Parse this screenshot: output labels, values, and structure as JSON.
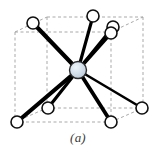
{
  "figure": {
    "caption": "(a)",
    "background_color": "#ffffff"
  },
  "style": {
    "cell_edge_color": "#a9a9a9",
    "cell_edge_dash": "3 2.5",
    "cell_edge_width": 1,
    "bond_color": "#000000",
    "bond_width_near": 4.2,
    "bond_width_far": 2.2,
    "corner_atom_fill": "#ffffff",
    "corner_atom_stroke": "#101010",
    "corner_atom_stroke_width": 1.6,
    "corner_atom_radius": 6,
    "center_atom_fill": "#ccd9e8",
    "center_atom_stroke": "#2b2b2b",
    "center_atom_stroke_width": 1.4,
    "center_atom_radius": 8.5,
    "center_atom_highlight": "#eef4fa"
  },
  "structure": {
    "type": "body-centered-cubic",
    "coordination_number": 8,
    "center_atom": {
      "id": "body-center",
      "label": "body-center atom",
      "x": 78,
      "y": 70,
      "fractional": [
        0.5,
        0.5,
        0.5
      ]
    },
    "corner_atoms": [
      {
        "id": "corner-front-top-left",
        "label": "front top left corner atom",
        "x": 33,
        "y": 23,
        "fractional": [
          0,
          1,
          0
        ]
      },
      {
        "id": "corner-back-top-left",
        "label": "back top left corner atom",
        "x": 93,
        "y": 16,
        "fractional": [
          0,
          1,
          1
        ]
      },
      {
        "id": "corner-back-top-right",
        "label": "back top right corner atom",
        "x": 113,
        "y": 27,
        "fractional": [
          1,
          1,
          1
        ]
      },
      {
        "id": "corner-front-top-right",
        "label": "front top right corner atom",
        "x": 111,
        "y": 33,
        "fractional": [
          1,
          1,
          0
        ]
      },
      {
        "id": "corner-front-bottom-left",
        "label": "front bottom left corner atom",
        "x": 17,
        "y": 122,
        "fractional": [
          0,
          0,
          0
        ]
      },
      {
        "id": "corner-back-bottom-left",
        "label": "back bottom left corner atom",
        "x": 48,
        "y": 108,
        "fractional": [
          0,
          0,
          1
        ]
      },
      {
        "id": "corner-front-bottom-right",
        "label": "front bottom right corner atom",
        "x": 111,
        "y": 122,
        "fractional": [
          1,
          0,
          0
        ]
      },
      {
        "id": "corner-back-bottom-right",
        "label": "back bottom right corner atom",
        "x": 142,
        "y": 108,
        "fractional": [
          1,
          0,
          1
        ]
      }
    ],
    "bonds": [
      {
        "id": "bond-front-top-left",
        "from": "body-center",
        "to": "corner-front-top-left",
        "x1": 78,
        "y1": 70,
        "x2": 33,
        "y2": 23,
        "width": 4.2
      },
      {
        "id": "bond-back-top-left",
        "from": "body-center",
        "to": "corner-back-top-left",
        "x1": 78,
        "y1": 70,
        "x2": 93,
        "y2": 16,
        "width": 3.2
      },
      {
        "id": "bond-back-top-right",
        "from": "body-center",
        "to": "corner-back-top-right",
        "x1": 78,
        "y1": 70,
        "x2": 113,
        "y2": 27,
        "width": 3.0
      },
      {
        "id": "bond-front-top-right",
        "from": "body-center",
        "to": "corner-front-top-right",
        "x1": 78,
        "y1": 70,
        "x2": 111,
        "y2": 33,
        "width": 3.6
      },
      {
        "id": "bond-front-bottom-left",
        "from": "body-center",
        "to": "corner-front-bottom-left",
        "x1": 78,
        "y1": 70,
        "x2": 17,
        "y2": 122,
        "width": 4.2
      },
      {
        "id": "bond-back-bottom-left",
        "from": "body-center",
        "to": "corner-back-bottom-left",
        "x1": 78,
        "y1": 70,
        "x2": 48,
        "y2": 108,
        "width": 3.2
      },
      {
        "id": "bond-front-bottom-right",
        "from": "body-center",
        "to": "corner-front-bottom-right",
        "x1": 78,
        "y1": 70,
        "x2": 111,
        "y2": 122,
        "width": 3.8
      },
      {
        "id": "bond-back-bottom-right",
        "from": "body-center",
        "to": "corner-back-bottom-right",
        "x1": 78,
        "y1": 70,
        "x2": 142,
        "y2": 108,
        "width": 2.6
      }
    ],
    "cell_vertices": {
      "front_top_left": {
        "x": 15,
        "y": 32
      },
      "front_top_right": {
        "x": 111,
        "y": 32
      },
      "front_bottom_left": {
        "x": 15,
        "y": 122
      },
      "front_bottom_right": {
        "x": 111,
        "y": 122
      },
      "back_top_left": {
        "x": 47,
        "y": 17
      },
      "back_top_right": {
        "x": 143,
        "y": 17
      },
      "back_bottom_left": {
        "x": 47,
        "y": 108
      },
      "back_bottom_right": {
        "x": 143,
        "y": 108
      }
    },
    "cell_edges": [
      {
        "id": "edge-front-top",
        "x1": 15,
        "y1": 32,
        "x2": 111,
        "y2": 32
      },
      {
        "id": "edge-front-bottom",
        "x1": 15,
        "y1": 122,
        "x2": 111,
        "y2": 122
      },
      {
        "id": "edge-front-left",
        "x1": 15,
        "y1": 32,
        "x2": 15,
        "y2": 122
      },
      {
        "id": "edge-front-right",
        "x1": 111,
        "y1": 32,
        "x2": 111,
        "y2": 122
      },
      {
        "id": "edge-back-top",
        "x1": 47,
        "y1": 17,
        "x2": 143,
        "y2": 17
      },
      {
        "id": "edge-back-bottom",
        "x1": 47,
        "y1": 108,
        "x2": 143,
        "y2": 108
      },
      {
        "id": "edge-back-left",
        "x1": 47,
        "y1": 17,
        "x2": 47,
        "y2": 108
      },
      {
        "id": "edge-back-right",
        "x1": 143,
        "y1": 17,
        "x2": 143,
        "y2": 108
      },
      {
        "id": "edge-depth-top-left",
        "x1": 15,
        "y1": 32,
        "x2": 47,
        "y2": 17
      },
      {
        "id": "edge-depth-top-right",
        "x1": 111,
        "y1": 32,
        "x2": 143,
        "y2": 17
      },
      {
        "id": "edge-depth-bottom-left",
        "x1": 15,
        "y1": 122,
        "x2": 47,
        "y2": 108
      },
      {
        "id": "edge-depth-bottom-right",
        "x1": 111,
        "y1": 122,
        "x2": 143,
        "y2": 108
      }
    ]
  }
}
